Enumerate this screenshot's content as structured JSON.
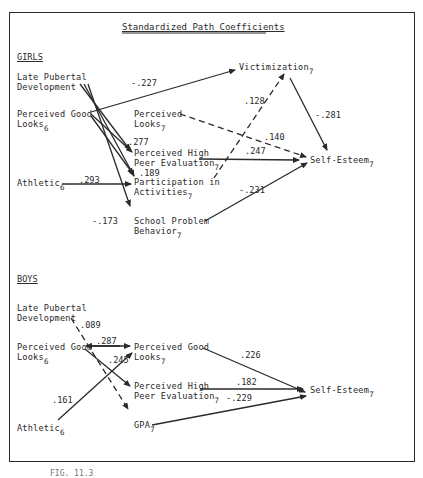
{
  "title": "Standardized Path Coefficients",
  "caption": "FIG. 11.3",
  "girls": {
    "section_label": "GIRLS",
    "nodes": {
      "late_pubertal": [
        "Late Pubertal",
        "Development"
      ],
      "perceived_good_looks_6": [
        "Perceived Good",
        "Looks"
      ],
      "perceived_good_looks_6_sub": "6",
      "athletic_6": "Athletic",
      "athletic_6_sub": "6",
      "victimization_7": "Victimization",
      "victimization_7_sub": "7",
      "perceived_looks_7": [
        "Perceived",
        "Looks"
      ],
      "perceived_looks_7_sub": "7",
      "peer_eval_7": [
        "Perceived High",
        "Peer Evaluation"
      ],
      "peer_eval_7_sub": "7",
      "participation_7": [
        "Participation in",
        "Activities"
      ],
      "participation_7_sub": "7",
      "school_problem_7": [
        "School Problem",
        "Behavior"
      ],
      "school_problem_7_sub": "7",
      "self_esteem_7": "Self-Esteem",
      "self_esteem_7_sub": "7"
    },
    "coefficients": {
      "looks6_to_victimization": "-.227",
      "participation_to_victimization": ".128",
      "victimization_to_selfesteem": "-.281",
      "looks6_to_peereval": ".277",
      "perceivedlooks7_to_selfesteem": ".140",
      "peereval_to_selfesteem": ".247",
      "looks6_to_participation": ".189",
      "athletic_to_participation": ".293",
      "schoolproblem_to_selfesteem": "-.231",
      "pubertal_to_schoolproblem": "-.173"
    }
  },
  "boys": {
    "section_label": "BOYS",
    "nodes": {
      "late_pubertal": [
        "Late Pubertal",
        "Development"
      ],
      "perceived_good_looks_6": [
        "Perceived Good",
        "Looks"
      ],
      "perceived_good_looks_6_sub": "6",
      "athletic_6": "Athletic",
      "athletic_6_sub": "6",
      "perceived_good_looks_7": [
        "Perceived Good",
        "Looks"
      ],
      "perceived_good_looks_7_sub": "7",
      "peer_eval_7": [
        "Perceived High",
        "Peer Evaluation"
      ],
      "peer_eval_7_sub": "7",
      "gpa_7": "GPA",
      "gpa_7_sub": "7",
      "self_esteem_7": "Self-Esteem",
      "self_esteem_7_sub": "7"
    },
    "coefficients": {
      "pubertal_to_gpa": ".089",
      "looks6_to_looks7": ".287",
      "looks6_to_peereval": ".245",
      "athletic_to_looks7": ".161",
      "looks7_to_selfesteem": ".226",
      "peereval_to_selfesteem": ".182",
      "gpa_to_selfesteem": "-.229"
    }
  }
}
